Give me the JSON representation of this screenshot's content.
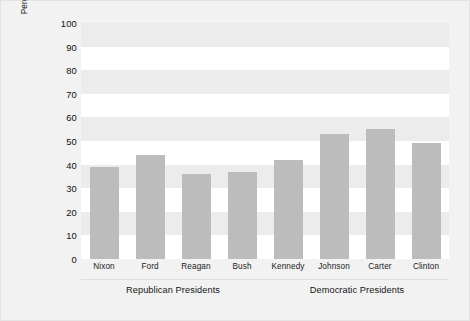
{
  "chart_data": {
    "type": "bar",
    "title": "",
    "xlabel": "",
    "ylabel_line1": "Policy Direction of Decision",
    "ylabel_line2": "Percentage Liberal",
    "categories": [
      "Nixon",
      "Ford",
      "Reagan",
      "Bush",
      "Kennedy",
      "Johnson",
      "Carter",
      "Clinton"
    ],
    "values": [
      39,
      44,
      36,
      37,
      42,
      53,
      55,
      49
    ],
    "ylim": [
      0,
      100
    ],
    "yticks": [
      100,
      90,
      80,
      70,
      60,
      50,
      40,
      30,
      20,
      10,
      0
    ],
    "grid": "alternating-horizontal-bands",
    "legend": "none",
    "bar_color": "#bcbcbc",
    "band_color": "#ececec",
    "plot_background": "#ffffff",
    "figure_background": "#f2f2f2",
    "groups": [
      {
        "label": "Republican Presidents",
        "members": [
          "Nixon",
          "Ford",
          "Reagan",
          "Bush"
        ]
      },
      {
        "label": "Democratic Presidents",
        "members": [
          "Kennedy",
          "Johnson",
          "Carter",
          "Clinton"
        ]
      }
    ]
  }
}
